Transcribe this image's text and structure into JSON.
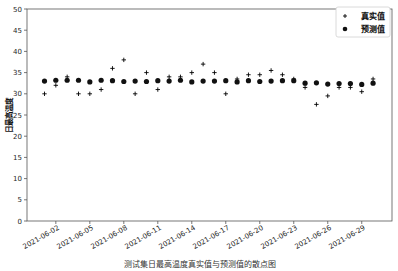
{
  "chart_data": {
    "type": "scatter",
    "title": "测试集日最高温度真实值与预测值的散点图",
    "xlabel": "",
    "ylabel": "日最高温度",
    "ylim": [
      0,
      50
    ],
    "yticks": [
      0,
      5,
      10,
      15,
      20,
      25,
      30,
      35,
      40,
      45,
      50
    ],
    "xticks": [
      "2021-06-02",
      "2021-06-05",
      "2021-06-08",
      "2021-06-11",
      "2021-06-14",
      "2021-06-17",
      "2021-06-20",
      "2021-06-23",
      "2021-06-26",
      "2021-06-29"
    ],
    "x": [
      "2021-06-01",
      "2021-06-02",
      "2021-06-03",
      "2021-06-04",
      "2021-06-05",
      "2021-06-06",
      "2021-06-07",
      "2021-06-08",
      "2021-06-09",
      "2021-06-10",
      "2021-06-11",
      "2021-06-12",
      "2021-06-13",
      "2021-06-14",
      "2021-06-15",
      "2021-06-16",
      "2021-06-17",
      "2021-06-18",
      "2021-06-19",
      "2021-06-20",
      "2021-06-21",
      "2021-06-22",
      "2021-06-23",
      "2021-06-24",
      "2021-06-25",
      "2021-06-26",
      "2021-06-27",
      "2021-06-28",
      "2021-06-29",
      "2021-06-30"
    ],
    "grid": false,
    "legend_position": "upper right",
    "series": [
      {
        "name": "真实值",
        "marker": "+",
        "color": "#000000",
        "values": [
          30,
          32,
          34,
          30,
          30,
          31,
          36,
          38,
          30,
          35,
          31,
          34,
          34,
          35,
          37,
          35,
          30,
          33.5,
          34.5,
          34.5,
          35.5,
          34.5,
          33.5,
          31.5,
          27.5,
          29.5,
          31.5,
          31.5,
          30.5,
          33.5
        ]
      },
      {
        "name": "预测值",
        "marker": "o",
        "color": "#111111",
        "values": [
          33,
          33.2,
          33.2,
          33.2,
          32.8,
          33.2,
          33.1,
          32.9,
          33,
          32.9,
          33.1,
          33,
          33.2,
          32.8,
          33,
          33,
          33.1,
          32.8,
          33.1,
          32.9,
          33,
          33.1,
          33.1,
          32.5,
          32.6,
          32.3,
          32.4,
          32.4,
          32.2,
          32.5
        ]
      }
    ]
  },
  "legend": {
    "items": [
      {
        "label": "真实值",
        "icon": "plus-marker-icon"
      },
      {
        "label": "预测值",
        "icon": "circle-marker-icon"
      }
    ]
  },
  "layout": {
    "plot": {
      "left": 27,
      "right": 392,
      "top": 9,
      "bottom": 221
    },
    "first_day_x": 44.5,
    "day_step": 11.33
  }
}
